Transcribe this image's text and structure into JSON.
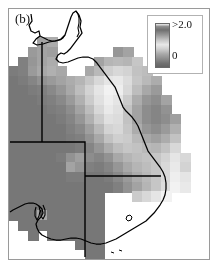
{
  "figure": {
    "panel_label": "(b)",
    "background": "#ffffff",
    "frame_color": "#9a9a9a"
  },
  "legend": {
    "name": "colorbar",
    "max_label": ">2.0",
    "min_label": "0",
    "orientation": "vertical",
    "box_color": "#ffffff",
    "border_color": "#b2b2b2"
  },
  "chart_data": {
    "type": "heatmap",
    "title": "(b)",
    "xlabel": "",
    "ylabel": "",
    "grid": false,
    "legend_position": "top-right",
    "colorbar": {
      "min": 0,
      "max": 2.0,
      "min_label": "0",
      "max_label": ">2.0",
      "scale": "grayscale"
    },
    "region": "eastern Australia",
    "cell_px": 9.5,
    "ncols": 21,
    "nrows": 26,
    "nodata_value": null,
    "nodata_color": "#ffffff",
    "palette": [
      "#5c5c5c",
      "#6e6e6e",
      "#7f7f7f",
      "#8f8f8f",
      "#9f9f9f",
      "#b0b0b0",
      "#c0c0c0",
      "#d0d0d0",
      "#e0e0e0",
      "#f0f0f0",
      "#ffffff"
    ],
    "grid_values": [
      [
        null,
        null,
        null,
        null,
        null,
        null,
        null,
        null,
        null,
        null,
        null,
        null,
        null,
        null,
        null,
        null,
        null,
        null,
        null,
        null,
        null
      ],
      [
        null,
        null,
        null,
        null,
        null,
        null,
        null,
        null,
        null,
        null,
        null,
        null,
        null,
        null,
        null,
        null,
        null,
        null,
        null,
        null,
        null
      ],
      [
        null,
        null,
        null,
        null,
        null,
        null,
        null,
        null,
        null,
        null,
        null,
        null,
        null,
        null,
        null,
        null,
        null,
        null,
        null,
        null,
        null
      ],
      [
        null,
        null,
        null,
        0.95,
        1.05,
        null,
        null,
        null,
        null,
        null,
        null,
        null,
        null,
        null,
        null,
        null,
        null,
        null,
        null,
        null,
        null
      ],
      [
        null,
        null,
        0.85,
        0.95,
        0.9,
        null,
        null,
        null,
        null,
        null,
        null,
        0.8,
        0.95,
        null,
        null,
        null,
        null,
        null,
        null,
        null,
        null
      ],
      [
        null,
        0.55,
        0.8,
        0.95,
        1.05,
        null,
        null,
        null,
        null,
        0.95,
        1.15,
        1.2,
        1.15,
        1.35,
        null,
        null,
        null,
        null,
        null,
        null,
        null
      ],
      [
        0.5,
        0.55,
        0.85,
        1.0,
        1.1,
        1.0,
        null,
        null,
        1.0,
        1.2,
        1.45,
        1.55,
        1.5,
        1.3,
        1.25,
        null,
        null,
        null,
        null,
        null,
        null
      ],
      [
        0.45,
        0.5,
        0.6,
        0.75,
        0.85,
        0.95,
        1.05,
        1.15,
        1.35,
        1.55,
        1.7,
        1.75,
        1.6,
        1.35,
        1.2,
        1.05,
        null,
        null,
        null,
        null,
        null
      ],
      [
        0.45,
        0.45,
        0.5,
        0.55,
        0.65,
        0.8,
        1.0,
        1.25,
        1.5,
        1.7,
        1.85,
        1.8,
        1.55,
        1.25,
        1.0,
        0.85,
        null,
        null,
        null,
        null,
        null
      ],
      [
        0.45,
        0.45,
        0.45,
        0.5,
        0.55,
        0.65,
        0.85,
        1.1,
        1.4,
        1.65,
        1.8,
        1.7,
        1.4,
        1.05,
        0.8,
        0.7,
        0.95,
        null,
        null,
        null,
        null
      ],
      [
        0.45,
        0.45,
        0.45,
        0.45,
        0.5,
        0.55,
        0.7,
        0.95,
        1.25,
        1.55,
        1.75,
        1.65,
        1.3,
        0.95,
        0.7,
        0.6,
        0.75,
        null,
        null,
        null,
        null
      ],
      [
        0.45,
        0.45,
        0.45,
        0.45,
        0.45,
        0.5,
        0.6,
        0.8,
        1.1,
        1.4,
        1.65,
        1.6,
        1.3,
        0.95,
        0.7,
        0.6,
        0.7,
        0.9,
        null,
        null,
        null
      ],
      [
        0.45,
        0.45,
        0.45,
        0.45,
        0.45,
        0.45,
        0.55,
        0.65,
        0.9,
        1.2,
        1.5,
        1.55,
        1.35,
        1.05,
        0.8,
        0.7,
        0.85,
        1.1,
        null,
        null,
        null
      ],
      [
        0.45,
        0.45,
        0.45,
        0.45,
        0.45,
        0.45,
        0.5,
        0.55,
        0.75,
        1.0,
        1.3,
        1.45,
        1.4,
        1.2,
        1.0,
        0.9,
        1.05,
        1.3,
        null,
        null,
        null
      ],
      [
        0.45,
        0.45,
        0.45,
        0.45,
        0.45,
        0.45,
        0.45,
        0.5,
        0.6,
        0.8,
        1.05,
        1.25,
        1.35,
        1.3,
        1.2,
        1.15,
        1.3,
        1.55,
        null,
        null,
        null
      ],
      [
        0.45,
        0.45,
        0.45,
        0.45,
        0.45,
        0.5,
        0.75,
        0.9,
        0.7,
        0.6,
        0.75,
        1.0,
        1.15,
        1.25,
        1.3,
        1.35,
        1.5,
        1.7,
        1.55,
        null,
        null
      ],
      [
        0.45,
        0.45,
        0.45,
        0.45,
        0.45,
        0.45,
        0.95,
        0.8,
        0.55,
        0.5,
        0.6,
        0.8,
        1.0,
        1.15,
        1.25,
        1.35,
        1.55,
        1.75,
        1.5,
        null,
        null
      ],
      [
        0.45,
        0.45,
        0.45,
        0.45,
        0.45,
        0.45,
        0.5,
        0.5,
        0.45,
        0.45,
        0.5,
        0.65,
        0.85,
        1.05,
        1.2,
        1.35,
        1.55,
        1.8,
        1.7,
        null,
        null
      ],
      [
        0.45,
        0.45,
        0.45,
        0.45,
        0.45,
        0.45,
        0.45,
        0.45,
        0.45,
        0.45,
        0.45,
        0.55,
        0.75,
        0.95,
        1.15,
        1.35,
        1.6,
        1.85,
        1.75,
        null,
        null
      ],
      [
        0.45,
        0.45,
        0.45,
        0.45,
        0.45,
        0.45,
        0.45,
        0.45,
        0.45,
        0.45,
        null,
        null,
        null,
        1.4,
        1.55,
        1.7,
        1.85,
        null,
        null,
        null,
        null
      ],
      [
        0.45,
        0.45,
        0.45,
        0.45,
        0.45,
        0.45,
        0.45,
        0.45,
        0.45,
        0.45,
        null,
        null,
        null,
        null,
        null,
        null,
        null,
        null,
        null,
        null,
        null
      ],
      [
        0.45,
        0.45,
        0.45,
        1.0,
        0.45,
        0.45,
        0.45,
        0.45,
        0.45,
        0.45,
        null,
        null,
        null,
        null,
        null,
        null,
        null,
        null,
        null,
        null,
        null
      ],
      [
        null,
        0.45,
        0.45,
        0.45,
        0.45,
        0.45,
        0.45,
        0.45,
        0.45,
        0.45,
        null,
        null,
        null,
        null,
        null,
        null,
        null,
        null,
        null,
        null,
        null
      ],
      [
        null,
        null,
        0.45,
        null,
        0.45,
        0.45,
        0.45,
        0.45,
        0.45,
        0.45,
        null,
        null,
        null,
        null,
        null,
        null,
        null,
        null,
        null,
        null,
        null
      ],
      [
        null,
        null,
        null,
        null,
        null,
        null,
        null,
        0.45,
        0.45,
        0.45,
        null,
        null,
        null,
        null,
        null,
        null,
        null,
        null,
        null,
        null,
        null
      ],
      [
        null,
        null,
        null,
        null,
        null,
        null,
        null,
        null,
        0.45,
        0.45,
        null,
        null,
        null,
        null,
        null,
        null,
        null,
        null,
        null,
        null,
        null
      ]
    ]
  },
  "map_overlay": {
    "coastline_color": "#000000",
    "border_color": "#000000",
    "coastline_name": "australia-coastline",
    "state_borders_name": "australia-state-borders"
  }
}
